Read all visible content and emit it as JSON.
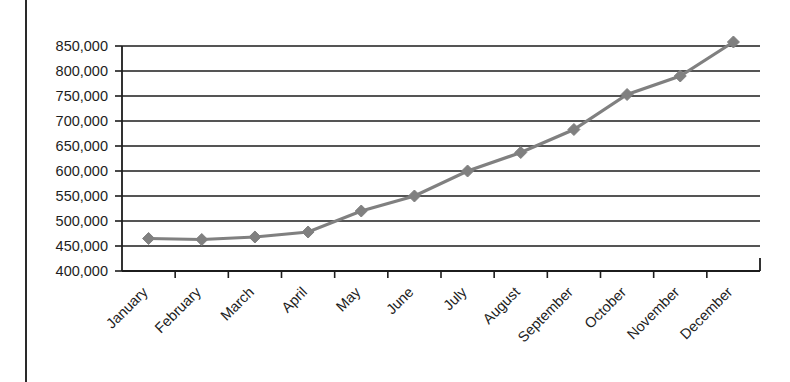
{
  "chart_data": {
    "type": "line",
    "title": "",
    "xlabel": "",
    "ylabel": "",
    "categories": [
      "January",
      "February",
      "March",
      "April",
      "May",
      "June",
      "July",
      "August",
      "September",
      "October",
      "November",
      "December"
    ],
    "values": [
      465000,
      463000,
      468000,
      478000,
      520000,
      550000,
      600000,
      637000,
      683000,
      753000,
      790000,
      858000
    ],
    "series": [
      {
        "name": "",
        "values": [
          465000,
          463000,
          468000,
          478000,
          520000,
          550000,
          600000,
          637000,
          683000,
          753000,
          790000,
          858000
        ]
      }
    ],
    "ylim": [
      400000,
      870000
    ],
    "y_ticks": [
      400000,
      450000,
      500000,
      550000,
      600000,
      650000,
      700000,
      750000,
      800000,
      850000
    ],
    "y_tick_labels": [
      "400,000",
      "450,000",
      "500,000",
      "550,000",
      "600,000",
      "650,000",
      "700,000",
      "750,000",
      "800,000",
      "850,000"
    ],
    "grid": true,
    "legend": false,
    "legend_position": "none",
    "marker": "diamond",
    "line_color": "#808080",
    "marker_color": "#808080",
    "axis_color": "#1c1c1c",
    "x_label_rotation": -45
  }
}
